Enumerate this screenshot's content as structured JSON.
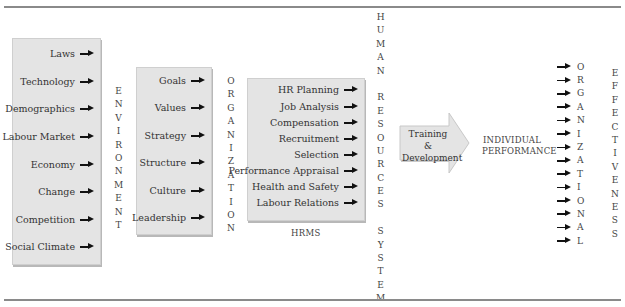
{
  "environment": {
    "items": [
      "Laws",
      "Technology",
      "Demographics",
      "Labour Market",
      "Economy",
      "Change",
      "Competition",
      "Social Climate"
    ],
    "vertical_label": [
      "E",
      "N",
      "V",
      "I",
      "R",
      "O",
      "N",
      "M",
      "E",
      "N",
      "T"
    ]
  },
  "organization": {
    "items": [
      "Goals",
      "Values",
      "Strategy",
      "Structure",
      "Culture",
      "Leadership"
    ],
    "vertical_label": [
      "O",
      "R",
      "G",
      "A",
      "N",
      "I",
      "Z",
      "A",
      "T",
      "I",
      "O",
      "N"
    ]
  },
  "hrms": {
    "items": [
      "HR Planning",
      "Job Analysis",
      "Compensation",
      "Recruitment",
      "Selection",
      "Performance Appraisal",
      "Health and Safety",
      "Labour Relations"
    ],
    "caption": "HRMS",
    "vertical_label_words": [
      [
        "H",
        "U",
        "M",
        "A",
        "N"
      ],
      [
        "R",
        "E",
        "S",
        "O",
        "U",
        "R",
        "C",
        "E",
        "S"
      ],
      [
        "S",
        "Y",
        "S",
        "T",
        "E",
        "M"
      ]
    ]
  },
  "training": {
    "line1": "Training",
    "line2": "&",
    "line3": "Development"
  },
  "individual_performance": {
    "line1": "INDIVIDUAL",
    "line2": "PERFORMANCE"
  },
  "organizational": {
    "letters": [
      "O",
      "R",
      "G",
      "A",
      "N",
      "I",
      "Z",
      "A",
      "T",
      "I",
      "O",
      "N",
      "A",
      "L"
    ]
  },
  "effectiveness": {
    "letters": [
      "E",
      "F",
      "F",
      "E",
      "C",
      "T",
      "I",
      "V",
      "E",
      "N",
      "E",
      "S",
      "S"
    ]
  },
  "colors": {
    "box_fill": "#e4e4e4",
    "arrow": "#111111",
    "rule": "#8a8a8a"
  }
}
